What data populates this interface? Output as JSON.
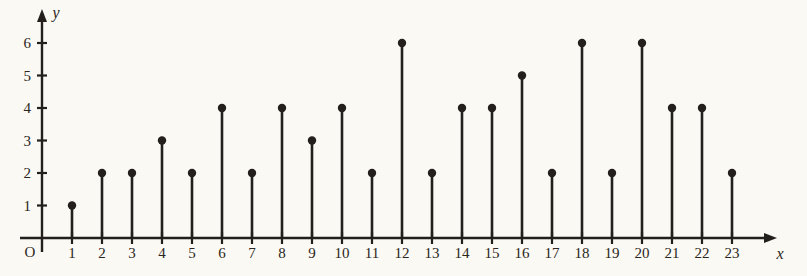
{
  "chart_data": {
    "type": "scatter",
    "subtype": "stem-plot",
    "title": "",
    "xlabel": "x",
    "ylabel": "y",
    "origin_label": "O",
    "grid": false,
    "legend": null,
    "x": [
      1,
      2,
      3,
      4,
      5,
      6,
      7,
      8,
      9,
      10,
      11,
      12,
      13,
      14,
      15,
      16,
      17,
      18,
      19,
      20,
      21,
      22,
      23
    ],
    "values": [
      1,
      2,
      2,
      3,
      2,
      4,
      2,
      4,
      3,
      4,
      2,
      6,
      2,
      4,
      4,
      5,
      2,
      6,
      2,
      6,
      4,
      4,
      2
    ],
    "xlim": [
      0,
      24
    ],
    "ylim": [
      0,
      6.4
    ],
    "x_tick_labels": [
      "1",
      "2",
      "3",
      "4",
      "5",
      "6",
      "7",
      "8",
      "9",
      "10",
      "11",
      "12",
      "13",
      "14",
      "15",
      "16",
      "17",
      "18",
      "19",
      "20",
      "21",
      "22",
      "23"
    ],
    "y_tick_labels": [
      "1",
      "2",
      "3",
      "4",
      "5",
      "6"
    ],
    "y_ticks": [
      1,
      2,
      3,
      4,
      5,
      6
    ],
    "marker": "filled-circle",
    "marker_color": "#231f1c",
    "stem_color": "#231f1c",
    "background_color": "#faf9f4"
  },
  "axes": {
    "x_name": "x",
    "y_name": "y",
    "origin": "O"
  }
}
